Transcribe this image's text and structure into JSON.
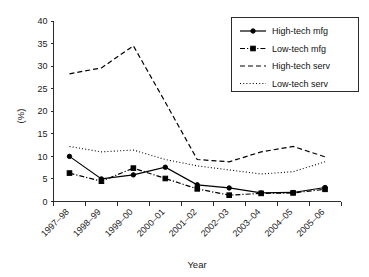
{
  "chart_data": {
    "type": "line",
    "title": "",
    "xlabel": "Year",
    "ylabel": "(%)",
    "categories": [
      "1997–98",
      "1998–99",
      "1999–00",
      "2000–01",
      "2001–02",
      "2002–03",
      "2003–04",
      "2004–05",
      "2005–06"
    ],
    "ylim": [
      0,
      40
    ],
    "yticks": [
      0,
      5,
      10,
      15,
      20,
      25,
      30,
      35,
      40
    ],
    "ytick_labels": [
      "0",
      "5",
      "10",
      "15",
      "20",
      "25",
      "30",
      "35",
      "40"
    ],
    "grid": false,
    "legend_position": "top-right",
    "series": [
      {
        "name": "High-tech mfg",
        "style": "solid",
        "marker": "circle",
        "values": [
          10.0,
          5.0,
          5.9,
          7.6,
          3.7,
          3.0,
          1.9,
          2.0,
          3.1
        ]
      },
      {
        "name": "Low-tech mfg",
        "style": "dash-dot",
        "marker": "square",
        "values": [
          6.3,
          4.5,
          7.4,
          5.1,
          2.8,
          1.4,
          1.8,
          1.9,
          2.7
        ]
      },
      {
        "name": "High-tech serv",
        "style": "dashed",
        "marker": "none",
        "values": [
          28.3,
          29.6,
          34.5,
          22.0,
          9.3,
          8.8,
          11.0,
          12.2,
          9.9
        ]
      },
      {
        "name": "Low-tech serv",
        "style": "dotted",
        "marker": "none",
        "values": [
          12.2,
          11.0,
          11.4,
          9.3,
          7.9,
          7.0,
          6.1,
          6.6,
          8.8
        ]
      }
    ]
  },
  "axes": {
    "x_axis_name": "Year",
    "y_axis_name": "(%)"
  },
  "legend": {
    "entries": [
      {
        "label": "High-tech mfg"
      },
      {
        "label": "Low-tech mfg"
      },
      {
        "label": "High-tech serv"
      },
      {
        "label": "Low-tech serv"
      }
    ]
  }
}
